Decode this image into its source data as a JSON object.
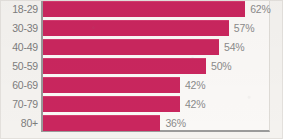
{
  "chart_data": {
    "type": "bar",
    "orientation": "horizontal",
    "title": "",
    "subtitle": "",
    "xlabel": "",
    "ylabel": "",
    "categories": [
      "18-29",
      "30-39",
      "40-49",
      "50-59",
      "60-69",
      "70-79",
      "80+"
    ],
    "values": [
      62,
      57,
      54,
      50,
      42,
      42,
      36
    ],
    "value_labels": [
      "62%",
      "57%",
      "54%",
      "50%",
      "42%",
      "42%",
      "36%"
    ],
    "xlim": [
      0,
      69
    ],
    "grid": false,
    "legend": null,
    "annotations": [],
    "colors": {
      "bar": "#c9265e",
      "bar_highlight": "#d43c70",
      "category_text": "#7d7d7d",
      "value_text": "#8a8a8a",
      "axis_line": "#9a9a9a",
      "plot_background": "#faf8f6",
      "page_background": "#f4f2ef"
    }
  },
  "rows": [
    {
      "category": "18-29",
      "value": 62,
      "label": "62%"
    },
    {
      "category": "30-39",
      "value": 57,
      "label": "57%"
    },
    {
      "category": "40-49",
      "value": 54,
      "label": "54%"
    },
    {
      "category": "50-59",
      "value": 50,
      "label": "50%"
    },
    {
      "category": "60-69",
      "value": 42,
      "label": "42%"
    },
    {
      "category": "70-79",
      "value": 42,
      "label": "42%"
    },
    {
      "category": "80+",
      "value": 36,
      "label": "36%"
    }
  ]
}
